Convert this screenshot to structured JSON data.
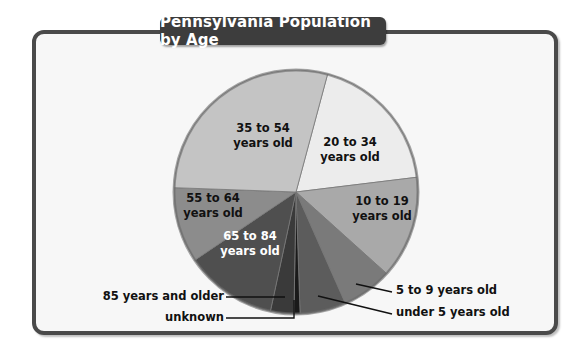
{
  "title": "Pennsylvania Population by Age",
  "chart_data": {
    "type": "pie",
    "title": "Pennsylvania Population by Age",
    "start_angle_deg": 15,
    "direction": "clockwise",
    "slices": [
      {
        "label": "20 to 34 years old",
        "value": 18.9,
        "color": "#ececec"
      },
      {
        "label": "10 to 19 years old",
        "value": 13.6,
        "color": "#a9a9a9"
      },
      {
        "label": "5 to 9 years old",
        "value": 6.7,
        "color": "#7a7a7a"
      },
      {
        "label": "under 5 years old",
        "value": 6.1,
        "color": "#5c5c5c"
      },
      {
        "label": "unknown",
        "value": 0.8,
        "color": "#1a1a1a"
      },
      {
        "label": "85 years and older",
        "value": 3.1,
        "color": "#3a3a3a"
      },
      {
        "label": "65 to 84 years old",
        "value": 12.2,
        "color": "#4f4f4f"
      },
      {
        "label": "55 to 64 years old",
        "value": 10.0,
        "color": "#8c8c8c"
      },
      {
        "label": "35 to 54 years old",
        "value": 28.6,
        "color": "#c4c4c4"
      }
    ],
    "unit": "percent (estimated from slice angles)"
  },
  "labels": {
    "s35_54": [
      "35 to 54",
      "years old"
    ],
    "s20_34": [
      "20 to 34",
      "years old"
    ],
    "s55_64": [
      "55 to 64",
      "years old"
    ],
    "s10_19": [
      "10 to 19",
      "years old"
    ],
    "s65_84": [
      "65 to 84",
      "years old"
    ],
    "c85": "85 years and older",
    "cunknown": "unknown",
    "c5_9": "5 to 9 years old",
    "cunder5": "under 5 years old"
  }
}
